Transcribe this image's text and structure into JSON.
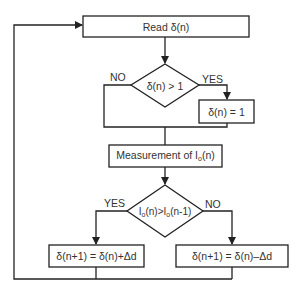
{
  "diagram": {
    "type": "flowchart",
    "line_color": "#222222",
    "text_color": "#333333",
    "background": "#ffffff",
    "nodes": {
      "read": {
        "shape": "process",
        "label": "Read δ(n)"
      },
      "decision1": {
        "shape": "decision",
        "label": "δ(n) > 1"
      },
      "clamp": {
        "shape": "process",
        "label": "δ(n) = 1"
      },
      "measure": {
        "shape": "process",
        "label_prefix": "Measurement of I",
        "label_sub": "o",
        "label_suffix": "(n)"
      },
      "decision2": {
        "shape": "decision",
        "label_a": "I",
        "label_a_sub": "o",
        "label_b": "(n)>I",
        "label_b_sub": "o",
        "label_c": "(n-1)"
      },
      "increase": {
        "shape": "process",
        "label": "δ(n+1) = δ(n)+Δd"
      },
      "decrease": {
        "shape": "process",
        "label": "δ(n+1) = δ(n)–Δd"
      }
    },
    "edge_labels": {
      "d1_no": "NO",
      "d1_yes": "YES",
      "d2_yes": "YES",
      "d2_no": "NO"
    },
    "edges": [
      {
        "from": "read",
        "to": "decision1"
      },
      {
        "from": "decision1",
        "to": "clamp",
        "label": "YES"
      },
      {
        "from": "decision1",
        "to": "measure",
        "label": "NO"
      },
      {
        "from": "clamp",
        "to": "measure"
      },
      {
        "from": "measure",
        "to": "decision2"
      },
      {
        "from": "decision2",
        "to": "increase",
        "label": "YES"
      },
      {
        "from": "decision2",
        "to": "decrease",
        "label": "NO"
      },
      {
        "from": "increase",
        "to": "read"
      },
      {
        "from": "decrease",
        "to": "read"
      }
    ]
  }
}
